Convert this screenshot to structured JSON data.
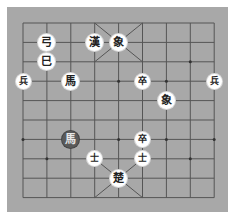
{
  "board": {
    "background": "#a8a8a8",
    "grid_color": "#555555",
    "columns": 9,
    "rows": 10,
    "origin": [
      23,
      23
    ],
    "col_step": 23.9,
    "row_step": 19.4
  },
  "pieces": [
    {
      "label": "弓",
      "col": 1,
      "row": 1,
      "side": "light",
      "size": "normal"
    },
    {
      "label": "巳",
      "col": 1,
      "row": 2,
      "side": "light",
      "size": "normal"
    },
    {
      "label": "漢",
      "col": 3,
      "row": 1,
      "side": "light",
      "size": "normal"
    },
    {
      "label": "象",
      "col": 4,
      "row": 1,
      "side": "light",
      "size": "normal"
    },
    {
      "label": "兵",
      "col": 0,
      "row": 3,
      "side": "light",
      "size": "small"
    },
    {
      "label": "馬",
      "col": 2,
      "row": 3,
      "side": "light",
      "size": "normal"
    },
    {
      "label": "卒",
      "col": 5,
      "row": 3,
      "side": "light",
      "size": "small"
    },
    {
      "label": "兵",
      "col": 8,
      "row": 3,
      "side": "light",
      "size": "small"
    },
    {
      "label": "象",
      "col": 6,
      "row": 4,
      "side": "light",
      "size": "normal"
    },
    {
      "label": "馬",
      "col": 2,
      "row": 6,
      "side": "dark",
      "size": "normal"
    },
    {
      "label": "卒",
      "col": 5,
      "row": 6,
      "side": "light",
      "size": "small"
    },
    {
      "label": "士",
      "col": 3,
      "row": 7,
      "side": "light",
      "size": "small"
    },
    {
      "label": "士",
      "col": 5,
      "row": 7,
      "side": "light",
      "size": "small"
    },
    {
      "label": "楚",
      "col": 4,
      "row": 8,
      "side": "light",
      "size": "normal"
    }
  ],
  "star_points": [
    [
      1,
      2
    ],
    [
      7,
      2
    ],
    [
      0,
      3
    ],
    [
      2,
      3
    ],
    [
      4,
      3
    ],
    [
      6,
      3
    ],
    [
      8,
      3
    ],
    [
      0,
      6
    ],
    [
      2,
      6
    ],
    [
      4,
      6
    ],
    [
      6,
      6
    ],
    [
      8,
      6
    ],
    [
      1,
      7
    ],
    [
      7,
      7
    ]
  ]
}
